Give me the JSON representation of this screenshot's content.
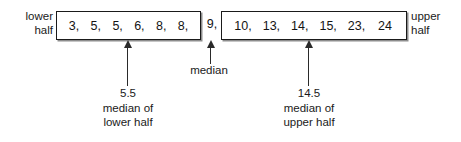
{
  "chart_data": {
    "type": "diagram",
    "dataset": [
      3,
      5,
      5,
      6,
      8,
      8,
      9,
      10,
      13,
      14,
      15,
      23,
      24
    ],
    "median": 9,
    "lower_half": [
      3,
      5,
      5,
      6,
      8,
      8
    ],
    "upper_half": [
      10,
      13,
      14,
      15,
      23,
      24
    ],
    "lower_half_median": 5.5,
    "upper_half_median": 14.5
  },
  "labels": {
    "lower_half": {
      "line1": "lower",
      "line2": "half"
    },
    "upper_half": {
      "line1": "upper",
      "line2": "half"
    }
  },
  "lower_box": {
    "cells": [
      "3,",
      "5,",
      "5,",
      "6,",
      "8,",
      "8,"
    ]
  },
  "median_cell": {
    "value": "9,"
  },
  "upper_box": {
    "cells": [
      "10,",
      "13,",
      "14,",
      "15,",
      "23,",
      "24"
    ]
  },
  "captions": {
    "median": {
      "line1": "median"
    },
    "lower": {
      "line1": "5.5",
      "line2": "median of",
      "line3": "lower half"
    },
    "upper": {
      "line1": "14.5",
      "line2": "median of",
      "line3": "upper half"
    }
  },
  "colors": {
    "ink": "#1a1a1a",
    "box_border": "#1a1a1a",
    "box_shadow": "#8d8d8d",
    "background": "#ffffff"
  }
}
